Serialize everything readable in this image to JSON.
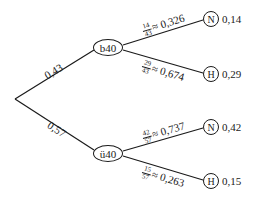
{
  "diagram": {
    "type": "probability-tree",
    "root": {
      "x": 15,
      "y": 99
    },
    "level1": [
      {
        "id": "b40",
        "label": "b40",
        "branch_prob": "0,43",
        "x": 108,
        "y": 47
      },
      {
        "id": "u40",
        "label": "ü40",
        "branch_prob": "0,57",
        "x": 108,
        "y": 153
      }
    ],
    "level2": [
      {
        "parent": "b40",
        "label": "N",
        "frac_num": "14",
        "frac_den": "43",
        "approx": "≈ 0,326",
        "joint": "0,14",
        "x": 211,
        "y": 19
      },
      {
        "parent": "b40",
        "label": "H",
        "frac_num": "29",
        "frac_den": "43",
        "approx": "≈ 0,674",
        "joint": "0,29",
        "x": 211,
        "y": 74
      },
      {
        "parent": "u40",
        "label": "N",
        "frac_num": "42",
        "frac_den": "57",
        "approx": "≈ 0,737",
        "joint": "0,42",
        "x": 211,
        "y": 127
      },
      {
        "parent": "u40",
        "label": "H",
        "frac_num": "15",
        "frac_den": "57",
        "approx": "≈ 0,263",
        "joint": "0,15",
        "x": 211,
        "y": 181
      }
    ]
  }
}
